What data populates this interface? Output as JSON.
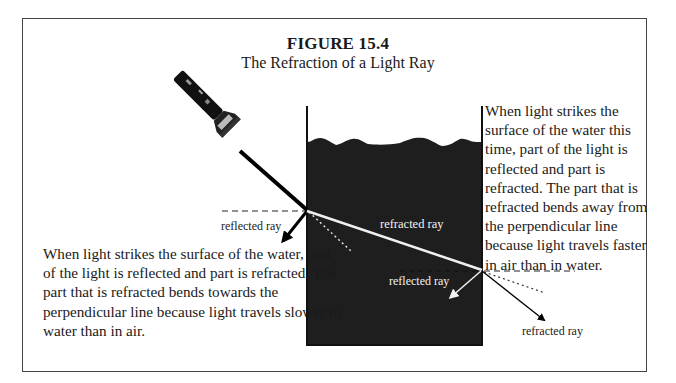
{
  "figure": {
    "title": "FIGURE 15.4",
    "subtitle": "The Refraction of a Light Ray"
  },
  "labels": {
    "reflected_ray_air": "reflected ray",
    "refracted_ray_water": "refracted ray",
    "reflected_ray_water": "reflected ray",
    "refracted_ray_air": "refracted ray"
  },
  "captions": {
    "left": "When light strikes the surface of the water, part of the light is reflected and part is refracted.  The part that is refracted bends towards the perpendicular line because light travels slower in water than in air.",
    "right": "When light strikes the surface of the water this time, part of the light is reflected and part is refracted.  The part that is refracted bends away from the perpendicular line because light travels faster in air than in water."
  },
  "illustration": {
    "light_source": "flashlight",
    "medium": "water tank",
    "water_color": "#1e1e1e",
    "ray_color_air": "#000000",
    "ray_color_water": "#f0f0f0"
  }
}
